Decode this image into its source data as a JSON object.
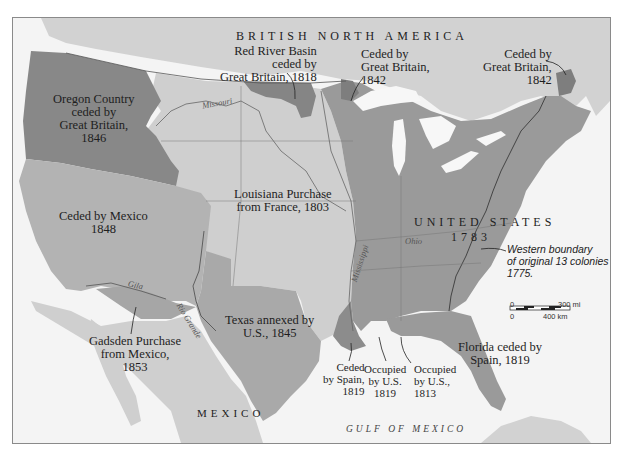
{
  "colors": {
    "ocean": "#f4f4f4",
    "foreign_land": "#d2d2d2",
    "us_1783": "#9a9a9a",
    "louisiana": "#cfcfcf",
    "mexico_cession": "#b3b3b3",
    "texas": "#a9a9a9",
    "dark_cession": "#888888",
    "lakes": "#f7f7f7",
    "border": "#555555",
    "text": "#1e1e1e"
  },
  "regions": {
    "british_north_america": {
      "label": "BRITISH NORTH AMERICA"
    },
    "united_states": {
      "label": "UNITED STATES",
      "year": "1783"
    },
    "mexico": {
      "label": "MEXICO"
    },
    "gulf": {
      "label": "GULF OF MEXICO"
    }
  },
  "annotations": {
    "oregon": [
      "Oregon Country",
      "ceded by",
      "Great Britain,",
      "1846"
    ],
    "red_river": [
      "Red River Basin",
      "ceded by",
      "Great Britain, 1818"
    ],
    "ceded_1842_west": [
      "Ceded by",
      "Great Britain,",
      "1842"
    ],
    "ceded_1842_east": [
      "Ceded by",
      "Great Britain,",
      "1842"
    ],
    "louisiana": [
      "Louisiana Purchase",
      "from France, 1803"
    ],
    "mexico_cession": [
      "Ceded by Mexico",
      "1848"
    ],
    "texas": [
      "Texas annexed by",
      "U.S., 1845"
    ],
    "gadsden": [
      "Gadsden Purchase",
      "from Mexico,",
      "1853"
    ],
    "ceded_spain_1819": [
      "Ceded",
      "by Spain,",
      "1819"
    ],
    "occupied_1819": [
      "Occupied",
      "by U.S.",
      "1819"
    ],
    "occupied_1813": [
      "Occupied",
      "by U.S.,",
      "1813"
    ],
    "florida": [
      "Florida ceded by",
      "Spain, 1819"
    ],
    "western_boundary": [
      "Western boundary",
      "of original 13 colonies",
      "1775."
    ]
  },
  "rivers": {
    "missouri": "Missouri",
    "gila": "Gila",
    "rio_grande": "Rio Grande",
    "mississippi": "Mississippi",
    "ohio": "Ohio"
  },
  "scale_bar": {
    "miles_start": "0",
    "miles_end": "300 mi",
    "km_start": "0",
    "km_end": "400 km"
  }
}
